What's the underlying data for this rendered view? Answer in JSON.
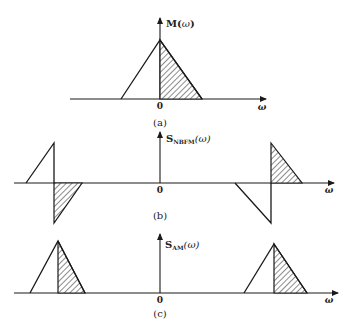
{
  "figure": {
    "panels": [
      {
        "id": "a",
        "caption": "(a)",
        "ylabel": "M(ω)",
        "ylabel_main": "M(",
        "ylabel_omega": "ω",
        "ylabel_close": ")",
        "origin": "0",
        "xlabel": "ω"
      },
      {
        "id": "b",
        "caption": "(b)",
        "ylabel": "S_NBFM(ω)",
        "ylabel_main": "S",
        "ylabel_sub": "NBFM",
        "ylabel_omega": "(ω)",
        "origin": "0",
        "xlabel": "ω"
      },
      {
        "id": "c",
        "caption": "(c)",
        "ylabel": "S_AM(ω)",
        "ylabel_main": "S",
        "ylabel_sub": "AM",
        "ylabel_omega": "(ω)",
        "origin": "0",
        "xlabel": "ω"
      }
    ]
  }
}
